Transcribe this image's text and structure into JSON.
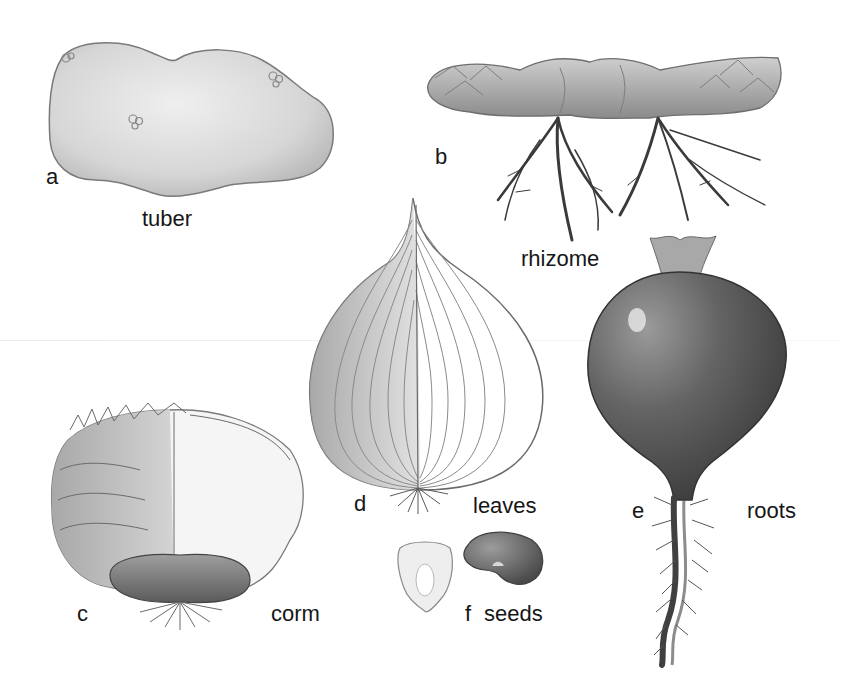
{
  "figure": {
    "title_cutoff": "",
    "specimens": [
      {
        "id": "a",
        "letter": "a",
        "label": "tuber",
        "organ": "potato-tuber"
      },
      {
        "id": "b",
        "letter": "b",
        "label": "rhizome",
        "organ": "rhizome"
      },
      {
        "id": "c",
        "letter": "c",
        "label": "corm",
        "organ": "corm"
      },
      {
        "id": "d",
        "letter": "d",
        "label": "leaves",
        "organ": "onion-bulb"
      },
      {
        "id": "e",
        "letter": "e",
        "label": "roots",
        "organ": "radish-root"
      },
      {
        "id": "f",
        "letter": "f",
        "label": "seeds",
        "organ": "corn-kernel-and-bean"
      }
    ]
  },
  "colors": {
    "background": "#ffffff",
    "label_text": "#161616",
    "tuber_fill": "#d9d9d9",
    "radish_fill": "#5e5e5e",
    "root_stroke": "#3a3a3a"
  }
}
